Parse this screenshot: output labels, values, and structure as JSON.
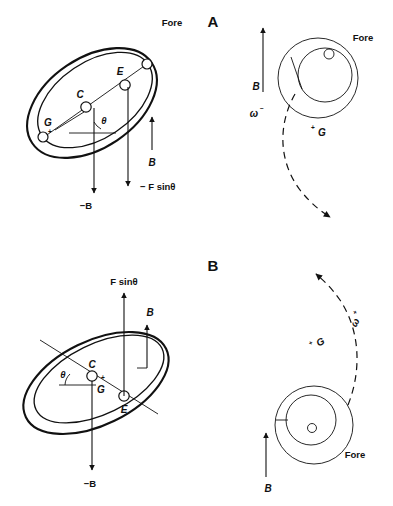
{
  "figure": {
    "background_color": "#ffffff",
    "ink_color": "#111111",
    "width": 393,
    "height": 506
  },
  "panels": [
    {
      "id": "A",
      "label": "A",
      "left_view": {
        "name": "tilted-ring-view-a",
        "fore_label": "Fore",
        "node_labels": {
          "center": "C",
          "eccentric": "E",
          "gravity": "G",
          "gravity_sign": "+"
        },
        "angle_label": "θ",
        "vectors": [
          {
            "name": "minus-b-vector",
            "label": "−B",
            "direction": "down"
          },
          {
            "name": "minus-f-sin-theta-vector",
            "label": "− F sinθ",
            "direction": "down"
          },
          {
            "name": "b-vector",
            "label": "B",
            "direction": "up"
          }
        ]
      },
      "right_view": {
        "name": "axial-disc-view-a",
        "fore_label": "Fore",
        "b_vector_label": "B",
        "b_vector_direction": "up",
        "omega_label": "ω",
        "omega_sign": "−",
        "gravity_label": "G",
        "gravity_sign": "+",
        "precession_direction": "clockwise-down"
      }
    },
    {
      "id": "B",
      "label": "B",
      "left_view": {
        "name": "tilted-ring-view-b",
        "node_labels": {
          "center": "C",
          "eccentric": "E",
          "gravity": "G",
          "gravity_sign": "+"
        },
        "angle_label": "θ",
        "vectors": [
          {
            "name": "f-sin-theta-vector",
            "label": "F sinθ",
            "direction": "up"
          },
          {
            "name": "b-vector",
            "label": "B",
            "direction": "up"
          },
          {
            "name": "minus-b-vector",
            "label": "−B",
            "direction": "down"
          }
        ]
      },
      "right_view": {
        "name": "axial-disc-view-b",
        "fore_label": "Fore",
        "b_vector_label": "B",
        "b_vector_direction": "up",
        "omega_label": "ω",
        "omega_sign": "+",
        "gravity_label": "G",
        "gravity_sign": "+",
        "precession_direction": "counterclockwise-up"
      }
    }
  ]
}
